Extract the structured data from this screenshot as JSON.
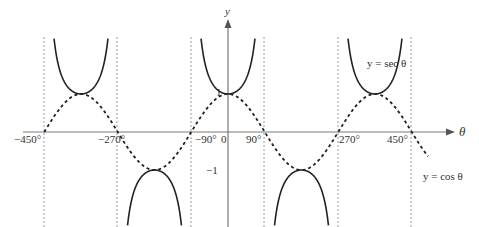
{
  "chart_data": {
    "type": "line",
    "title": "",
    "xlabel": "θ",
    "ylabel": "y",
    "xlim": [
      -500,
      520
    ],
    "ylim": [
      -2.5,
      2.8
    ],
    "grid": false,
    "x_tick_labels": [
      "−450°",
      "−270°",
      "−90°",
      "0",
      "90°",
      "270°",
      "450°"
    ],
    "x_ticks": [
      -450,
      -270,
      -90,
      0,
      90,
      270,
      450
    ],
    "y_tick_labels": [
      "1",
      "−1"
    ],
    "y_ticks": [
      1,
      -1
    ],
    "asymptotes": [
      -450,
      -270,
      -90,
      90,
      270,
      450
    ],
    "series": [
      {
        "name": "y = sec θ",
        "style": "solid",
        "function": "1/cos(θ)"
      },
      {
        "name": "y = cos θ",
        "style": "dashed",
        "function": "cos(θ)"
      }
    ],
    "annotations": [
      {
        "text": "y = sec θ",
        "near": "upper right branch"
      },
      {
        "text": "y = cos θ",
        "near": "right end of cosine curve"
      }
    ]
  },
  "labels": {
    "y_axis": "y",
    "x_axis": "θ",
    "one": "1",
    "minus_one": "−1",
    "sec_label": "y = sec θ",
    "cos_label": "y = cos θ",
    "ticks": {
      "m450": "−450°",
      "m270": "−270°",
      "m90": "−90°",
      "zero": "0",
      "p90": "90°",
      "p270": "270°",
      "p450": "450°"
    }
  },
  "colors": {
    "axis": "#7a7a7a",
    "curve": "#222222",
    "asymptote": "#9a9a9a"
  }
}
